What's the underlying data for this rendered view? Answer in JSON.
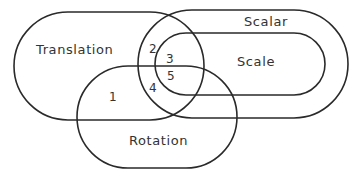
{
  "diagram": {
    "type": "venn",
    "sets": [
      {
        "id": "translation",
        "label": "Translation"
      },
      {
        "id": "scalar",
        "label": "Scalar"
      },
      {
        "id": "scale",
        "label": "Scale"
      },
      {
        "id": "rotation",
        "label": "Rotation"
      }
    ],
    "regions": [
      {
        "id": "1",
        "label": "1"
      },
      {
        "id": "2",
        "label": "2"
      },
      {
        "id": "3",
        "label": "3"
      },
      {
        "id": "4",
        "label": "4"
      },
      {
        "id": "5",
        "label": "5"
      }
    ],
    "stroke_color": "#2a2a2a",
    "background": "#ffffff"
  }
}
